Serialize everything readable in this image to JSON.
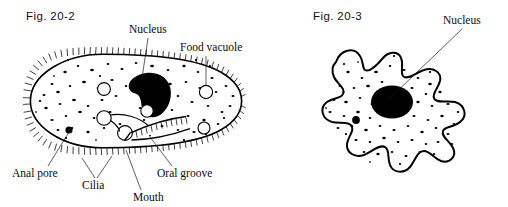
{
  "page": {
    "background": "#ffffff",
    "ink": "#000000",
    "width": 508,
    "height": 207
  },
  "figures": [
    {
      "id": "fig-20-2",
      "caption": "Fig. 20-2",
      "organism": "paramecium",
      "caption_pos": {
        "x": 26,
        "y": 20
      },
      "labels": [
        {
          "name": "nucleus",
          "text": "Nucleus",
          "x": 129,
          "y": 33,
          "anchor": "start",
          "leader": [
            [
              148,
              38
            ],
            [
              142,
              78
            ]
          ]
        },
        {
          "name": "food-vacuole",
          "text": "Food vacuole",
          "x": 180,
          "y": 51,
          "anchor": "start",
          "leader": [
            [
              206,
              56
            ],
            [
              206,
              86
            ]
          ]
        },
        {
          "name": "anal-pore",
          "text": "Anal pore",
          "x": 12,
          "y": 177,
          "anchor": "start",
          "leader": [
            [
              48,
              166
            ],
            [
              69,
              131
            ]
          ]
        },
        {
          "name": "cilia",
          "text": "Cilia",
          "x": 82,
          "y": 189,
          "anchor": "start",
          "leader": [
            [
              95,
              178
            ],
            [
              84,
              159
            ]
          ]
        },
        {
          "name": "mouth",
          "text": "Mouth",
          "x": 133,
          "y": 201,
          "anchor": "start",
          "leader": [
            [
              141,
              190
            ],
            [
              125,
              152
            ]
          ]
        },
        {
          "name": "oral-groove",
          "text": "Oral groove",
          "x": 157,
          "y": 177,
          "anchor": "start",
          "leader": [
            [
              172,
              166
            ],
            [
              150,
              138
            ]
          ]
        }
      ]
    },
    {
      "id": "fig-20-3",
      "caption": "Fig. 20-3",
      "organism": "amoeba",
      "caption_pos": {
        "x": 313,
        "y": 20
      },
      "labels": [
        {
          "name": "nucleus",
          "text": "Nucleus",
          "x": 443,
          "y": 24,
          "anchor": "start",
          "leader": [
            [
              462,
              29
            ],
            [
              389,
              98
            ]
          ]
        }
      ]
    }
  ],
  "structures": {
    "paramecium": {
      "nucleus_shape": "kidney-bean-solid-black",
      "food_vacuoles": 4,
      "contractile_vacuoles": 2,
      "anal_pore": 1,
      "cilia_fringe": true
    },
    "amoeba": {
      "nucleus_shape": "solid-black-ellipse",
      "pseudopod_lobes": 9,
      "cilia_fringe": false
    }
  }
}
